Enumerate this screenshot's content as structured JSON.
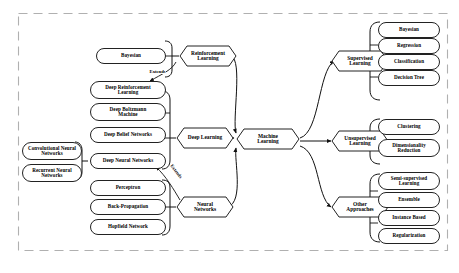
{
  "diagram": {
    "title_text": "",
    "frame": {
      "style": "dashed",
      "color": "#aaaaaa"
    },
    "center": {
      "label": "Machine\nLearning",
      "line1": "Machine",
      "line2": "Learning"
    },
    "edge_labels": [
      {
        "id": "extends-1",
        "text": "Extends"
      },
      {
        "id": "extends-2",
        "text": "Extends"
      }
    ],
    "branches": {
      "reinforcement_learning": {
        "line1": "Reinforcement",
        "line2": "Learning",
        "children": [
          {
            "line1": "Bayesian",
            "line2": ""
          }
        ]
      },
      "deep_learning": {
        "line1": "Deep Learning",
        "line2": "",
        "children": [
          {
            "line1": "Deep Reinforcement",
            "line2": "Learning"
          },
          {
            "line1": "Deep Boltzmann",
            "line2": "Machine"
          },
          {
            "line1": "Deep Belief Networks",
            "line2": ""
          },
          {
            "line1": "Deep Neural Networks",
            "line2": ""
          }
        ]
      },
      "deep_neural_networks": {
        "children": [
          {
            "line1": "Convolutional Neural",
            "line2": "Networks"
          },
          {
            "line1": "Recurrent Neural",
            "line2": "Networks"
          }
        ]
      },
      "neural_networks": {
        "line1": "Neural",
        "line2": "Networks",
        "children": [
          {
            "line1": "Perceptron",
            "line2": ""
          },
          {
            "line1": "Back-Propagation",
            "line2": ""
          },
          {
            "line1": "Hopfield Network",
            "line2": ""
          }
        ]
      },
      "supervised_learning": {
        "line1": "Supervised",
        "line2": "Learning",
        "children": [
          {
            "line1": "Bayesian",
            "line2": ""
          },
          {
            "line1": "Regression",
            "line2": ""
          },
          {
            "line1": "Classification",
            "line2": ""
          },
          {
            "line1": "Decision Tree",
            "line2": ""
          }
        ]
      },
      "unsupervised_learning": {
        "line1": "Unsupervised",
        "line2": "Learning",
        "children": [
          {
            "line1": "Clustering",
            "line2": ""
          },
          {
            "line1": "Dimensionality",
            "line2": "Reduction"
          }
        ]
      },
      "other_approaches": {
        "line1": "Other",
        "line2": "Approaches",
        "children": [
          {
            "line1": "Semi-supervised",
            "line2": "Learning"
          },
          {
            "line1": "Ensemble",
            "line2": ""
          },
          {
            "line1": "Instance Based",
            "line2": ""
          },
          {
            "line1": "Regularization",
            "line2": ""
          }
        ]
      }
    }
  }
}
